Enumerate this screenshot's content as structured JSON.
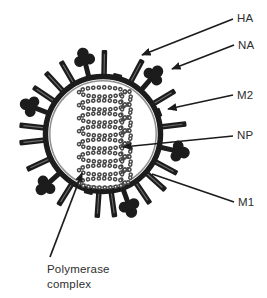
{
  "colors": {
    "background": "#ffffff",
    "ink": "#1c1c1c",
    "membrane_inner_line": "#8f8f8f",
    "rod_highlight": "#6e6e6e",
    "bead_ring": "#474747",
    "bead_hole": "#ffffff",
    "text": "#2e2e2e"
  },
  "virion": {
    "center": {
      "x": 103,
      "y": 134
    },
    "membrane_radius": 57.5,
    "spikes": [
      {
        "angle": 7,
        "type": "rod"
      },
      {
        "angle": 21,
        "type": "m2"
      },
      {
        "angle": 31,
        "type": "rod"
      },
      {
        "angle": 49,
        "type": "na"
      },
      {
        "angle": 62,
        "type": "rod"
      },
      {
        "angle": 76,
        "type": "m2"
      },
      {
        "angle": 89,
        "type": "rod"
      },
      {
        "angle": 104,
        "type": "na"
      },
      {
        "angle": 120,
        "type": "rod"
      },
      {
        "angle": 133,
        "type": "rod"
      },
      {
        "angle": 146,
        "type": "rod"
      },
      {
        "angle": 159,
        "type": "na"
      },
      {
        "angle": 174,
        "type": "rod"
      },
      {
        "angle": 186,
        "type": "rod"
      },
      {
        "angle": 205,
        "type": "rod"
      },
      {
        "angle": 222,
        "type": "na"
      },
      {
        "angle": 238,
        "type": "rod"
      },
      {
        "angle": 256,
        "type": "m2"
      },
      {
        "angle": 266,
        "type": "rod"
      },
      {
        "angle": 278,
        "type": "rod"
      },
      {
        "angle": 290,
        "type": "na"
      },
      {
        "angle": 304,
        "type": "rod"
      },
      {
        "angle": 318,
        "type": "rod"
      },
      {
        "angle": 332,
        "type": "rod"
      },
      {
        "angle": 347,
        "type": "na"
      }
    ],
    "rnp_coil": {
      "rows": 8,
      "top_y": 92,
      "pitch": 13,
      "cx": 102,
      "rx": 23,
      "ry": 4.6,
      "loop_cx": 126,
      "loop_rx": 4.4,
      "loop_ry": 8.2
    }
  },
  "callouts": {
    "ha": {
      "label": "HA",
      "line": [
        233,
        19,
        142,
        55
      ],
      "arrow": true
    },
    "na": {
      "label": "NA",
      "line": [
        234,
        45,
        172,
        69
      ],
      "arrow": true
    },
    "m2": {
      "label": "M2",
      "line": [
        233,
        95,
        168,
        109
      ],
      "arrow": true
    },
    "np": {
      "label": "NP",
      "line": [
        233,
        136,
        123,
        147
      ],
      "arrow": true
    },
    "m1": {
      "label": "M1",
      "line": [
        234,
        202,
        152,
        174
      ],
      "arrow": false
    },
    "polymerase": {
      "lines": [
        "Polymerase",
        "complex"
      ],
      "line": [
        50,
        257,
        82,
        173
      ],
      "arrow": true
    }
  }
}
